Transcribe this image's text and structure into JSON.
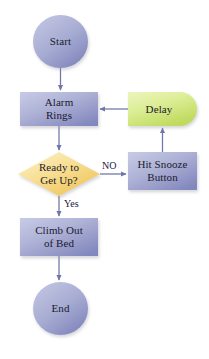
{
  "diagram": {
    "background_color": "#ffffff",
    "nodes": [
      {
        "id": "start",
        "label": "Start",
        "shape": "circle",
        "fill_from": "#b9bcdd",
        "fill_to": "#7d82ba",
        "x": 33,
        "y": 15,
        "w": 55,
        "h": 53
      },
      {
        "id": "alarm-rings",
        "label": "Alarm\nRings",
        "shape": "rectangle",
        "fill_from": "#c3c6e2",
        "fill_to": "#8a8fc0",
        "x": 20,
        "y": 92,
        "w": 78,
        "h": 34
      },
      {
        "id": "delay",
        "label": "Delay",
        "shape": "delay",
        "fill_from": "#e4f0a8",
        "fill_to": "#c2dc62",
        "x": 128,
        "y": 92,
        "w": 69,
        "h": 34
      },
      {
        "id": "ready-to-get-up",
        "label": "Ready to\nGet Up?",
        "shape": "diamond",
        "fill_from": "#fbeab4",
        "fill_to": "#efc55a",
        "x": 18,
        "y": 152,
        "w": 82,
        "h": 44
      },
      {
        "id": "hit-snooze-button",
        "label": "Hit Snooze\nButton",
        "shape": "rectangle",
        "fill_from": "#c3c6e2",
        "fill_to": "#8a8fc0",
        "x": 128,
        "y": 152,
        "w": 69,
        "h": 38
      },
      {
        "id": "climb-out-of-bed",
        "label": "Climb Out\nof Bed",
        "shape": "rectangle",
        "fill_from": "#c3c6e2",
        "fill_to": "#8a8fc0",
        "x": 20,
        "y": 218,
        "w": 78,
        "h": 38
      },
      {
        "id": "end",
        "label": "End",
        "shape": "circle",
        "fill_from": "#b9bcdd",
        "fill_to": "#7d82ba",
        "x": 33,
        "y": 282,
        "w": 55,
        "h": 53
      }
    ],
    "edges": [
      {
        "id": "start-to-alarm",
        "from": "start",
        "to": "alarm-rings",
        "label": ""
      },
      {
        "id": "alarm-to-decision",
        "from": "alarm-rings",
        "to": "ready-to-get-up",
        "label": ""
      },
      {
        "id": "decision-to-snooze",
        "from": "ready-to-get-up",
        "to": "hit-snooze-button",
        "label": "NO"
      },
      {
        "id": "snooze-to-delay",
        "from": "hit-snooze-button",
        "to": "delay",
        "label": ""
      },
      {
        "id": "delay-to-alarm",
        "from": "delay",
        "to": "alarm-rings",
        "label": ""
      },
      {
        "id": "decision-to-climb",
        "from": "ready-to-get-up",
        "to": "climb-out-of-bed",
        "label": "Yes"
      },
      {
        "id": "climb-to-end",
        "from": "climb-out-of-bed",
        "to": "end",
        "label": ""
      }
    ],
    "edge_labels": {
      "no": "NO",
      "yes": "Yes"
    },
    "connector_color": "#7b82b4",
    "caption": ""
  }
}
